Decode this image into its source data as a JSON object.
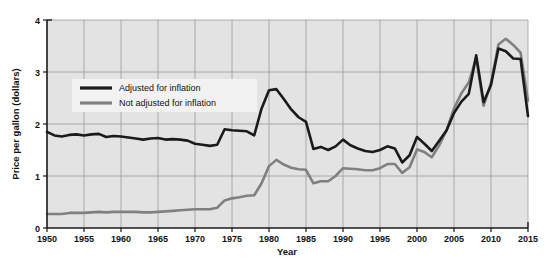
{
  "chart_data": {
    "type": "line",
    "title": "",
    "xlabel": "Year",
    "ylabel": "Price per gallon (dollars)",
    "xlim": [
      1950,
      2015
    ],
    "ylim": [
      0,
      4
    ],
    "grid": true,
    "legend_position": "upper-left-inside",
    "xticks": [
      1950,
      1955,
      1960,
      1965,
      1970,
      1975,
      1980,
      1985,
      1990,
      1995,
      2000,
      2005,
      2010,
      2015
    ],
    "yticks": [
      0,
      1,
      2,
      3,
      4
    ],
    "colors": {
      "adjusted": "#1a1a1a",
      "not_adjusted": "#808080",
      "plot_background": "#e3e3e3",
      "gridline": "#9a9a9a",
      "axis": "#1a1a1a",
      "page_background": "#ffffff"
    },
    "x": [
      1950,
      1951,
      1952,
      1953,
      1954,
      1955,
      1956,
      1957,
      1958,
      1959,
      1960,
      1961,
      1962,
      1963,
      1964,
      1965,
      1966,
      1967,
      1968,
      1969,
      1970,
      1971,
      1972,
      1973,
      1974,
      1975,
      1976,
      1977,
      1978,
      1979,
      1980,
      1981,
      1982,
      1983,
      1984,
      1985,
      1986,
      1987,
      1988,
      1989,
      1990,
      1991,
      1992,
      1993,
      1994,
      1995,
      1996,
      1997,
      1998,
      1999,
      2000,
      2001,
      2002,
      2003,
      2004,
      2005,
      2006,
      2007,
      2008,
      2009,
      2010,
      2011,
      2012,
      2013,
      2014,
      2015
    ],
    "series": [
      {
        "name": "Adjusted for inflation",
        "color": "#1a1a1a",
        "values": [
          1.85,
          1.78,
          1.76,
          1.79,
          1.8,
          1.78,
          1.8,
          1.81,
          1.75,
          1.77,
          1.76,
          1.74,
          1.72,
          1.7,
          1.72,
          1.73,
          1.7,
          1.71,
          1.7,
          1.68,
          1.62,
          1.6,
          1.58,
          1.6,
          1.9,
          1.88,
          1.87,
          1.86,
          1.78,
          2.3,
          2.65,
          2.67,
          2.48,
          2.28,
          2.13,
          2.04,
          1.52,
          1.56,
          1.5,
          1.57,
          1.7,
          1.59,
          1.53,
          1.48,
          1.46,
          1.5,
          1.57,
          1.53,
          1.26,
          1.4,
          1.75,
          1.62,
          1.48,
          1.68,
          1.88,
          2.21,
          2.43,
          2.58,
          3.32,
          2.42,
          2.75,
          3.45,
          3.4,
          3.26,
          3.25,
          2.15
        ]
      },
      {
        "name": "Not adjusted for inflation",
        "color": "#808080",
        "values": [
          0.27,
          0.27,
          0.27,
          0.29,
          0.29,
          0.29,
          0.3,
          0.31,
          0.3,
          0.31,
          0.31,
          0.31,
          0.31,
          0.3,
          0.3,
          0.31,
          0.32,
          0.33,
          0.34,
          0.35,
          0.36,
          0.36,
          0.36,
          0.39,
          0.53,
          0.57,
          0.59,
          0.62,
          0.63,
          0.86,
          1.19,
          1.31,
          1.22,
          1.16,
          1.13,
          1.12,
          0.86,
          0.9,
          0.9,
          1.0,
          1.15,
          1.14,
          1.13,
          1.11,
          1.11,
          1.15,
          1.23,
          1.23,
          1.06,
          1.17,
          1.51,
          1.46,
          1.36,
          1.59,
          1.88,
          2.3,
          2.59,
          2.8,
          3.27,
          2.35,
          2.79,
          3.53,
          3.64,
          3.52,
          3.37,
          2.45
        ]
      }
    ]
  },
  "legend": {
    "items": [
      {
        "label": "Adjusted for inflation",
        "color": "#1a1a1a"
      },
      {
        "label": "Not adjusted for inflation",
        "color": "#808080"
      }
    ]
  },
  "axes": {
    "y_label": "Price per gallon (dollars)",
    "x_label": "Year",
    "y_tick_labels": [
      "0",
      "1",
      "2",
      "3",
      "4"
    ],
    "x_tick_labels": [
      "1950",
      "1955",
      "1960",
      "1965",
      "1970",
      "1975",
      "1980",
      "1985",
      "1990",
      "1995",
      "2000",
      "2005",
      "2010",
      "2015"
    ]
  }
}
